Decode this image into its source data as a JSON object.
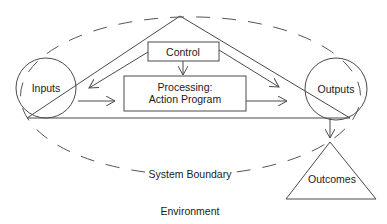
{
  "diagram": {
    "nodes": {
      "inputs": {
        "label": "Inputs",
        "shape": "circle"
      },
      "outputs": {
        "label": "Outputs",
        "shape": "circle"
      },
      "control": {
        "label": "Control",
        "shape": "rectangle"
      },
      "processing": {
        "label_line1": "Processing:",
        "label_line2": "Action Program",
        "shape": "rectangle"
      },
      "outcomes": {
        "label": "Outcomes",
        "shape": "triangle"
      }
    },
    "regions": {
      "system_boundary": {
        "label": "System Boundary",
        "style": "dashed-ellipse"
      },
      "environment": {
        "label": "Environment"
      }
    },
    "edges": [
      {
        "from": "control",
        "to": "processing"
      },
      {
        "from": "control",
        "to": "inputs"
      },
      {
        "from": "control",
        "to": "outputs"
      },
      {
        "from": "inputs",
        "to": "processing"
      },
      {
        "from": "processing",
        "to": "outputs"
      },
      {
        "from": "outputs",
        "to": "outcomes"
      }
    ],
    "colors": {
      "stroke": "#4a4a4a",
      "text": "#1a1a1a",
      "background": "#ffffff"
    }
  }
}
